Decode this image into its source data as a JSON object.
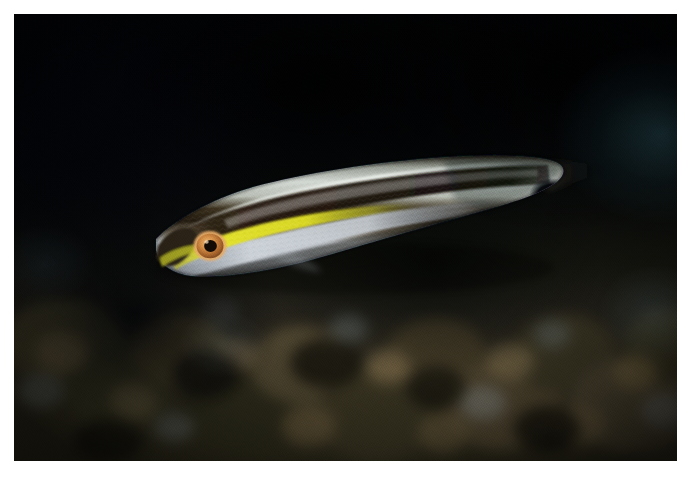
{
  "page": {
    "background_color": "#ffffff",
    "width": 689,
    "height": 484
  },
  "photo": {
    "name": "underwater-fish-photograph",
    "subject": "slender reef wrasse",
    "orientation": "landscape",
    "frame": {
      "x": 14,
      "y": 14,
      "width": 663,
      "height": 447
    },
    "background_description": "dark blurred coral reef at depth",
    "colors": {
      "backdrop_black": "#04060b",
      "reef_olive": "#332f1f",
      "reef_tan": "#6b5c42",
      "water_teal": "#3c7a86",
      "rubble_pale": "#8d9aa0"
    }
  },
  "fish": {
    "name": "fish-subject",
    "facing": "left",
    "features": {
      "eye_iris_color": "#c8813f",
      "eye_ring_color": "#e0a463",
      "pupil_color": "#1a0f06",
      "lateral_stripe_color": "#261a0e",
      "cheek_stripe_color": "#d6d521",
      "dorsal_band_color": "#cfd6d2",
      "belly_color": "#b9bec6",
      "snout_color": "#2a2414",
      "peduncle_spot_color": "#05060a"
    },
    "anatomy": [
      "snout",
      "eye",
      "yellow-cheek-stripe",
      "dark-lateral-stripe",
      "pale-dorsal-band",
      "silver-belly",
      "caudal-peduncle-spot",
      "caudal-fin"
    ]
  },
  "caption": {
    "name": "plate-caption",
    "text": "",
    "visible": false,
    "note": "caption row is cropped at the page edge; glyphs are not legible"
  }
}
